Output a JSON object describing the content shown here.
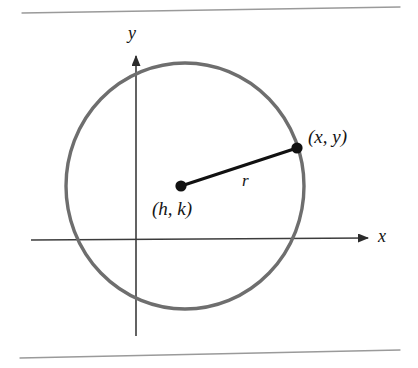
{
  "figure": {
    "kind": "geometry-diagram",
    "width": 418,
    "height": 368,
    "background_color": "#ffffff"
  },
  "colors": {
    "circle_stroke": "#6e6e6e",
    "axis_stroke": "#3c3c3c",
    "radius_stroke": "#111111",
    "dot_fill": "#111111",
    "rule_stroke": "#9a9a9a",
    "label_color": "#141414"
  },
  "rules": {
    "top": {
      "name": "top-rule",
      "x1": 22,
      "y1": 13,
      "x2": 400,
      "y2": 7
    },
    "bottom": {
      "name": "bottom-rule",
      "x1": 20,
      "y1": 358,
      "x2": 400,
      "y2": 350
    }
  },
  "axes": {
    "x_axis": {
      "label": "x",
      "x1": 31,
      "y1": 240,
      "x2": 368,
      "y2": 238,
      "arrow": "right",
      "label_x": 378,
      "label_y": 236
    },
    "y_axis": {
      "label": "y",
      "x1": 136,
      "y1": 336,
      "x2": 136,
      "y2": 56,
      "arrow": "up",
      "label_x": 133,
      "label_y": 33
    }
  },
  "circle": {
    "name": "circle-outline",
    "center_x": 185,
    "center_y": 186,
    "radius_x": 119,
    "radius_y": 123,
    "stroke_width": 3.4
  },
  "center_point": {
    "name": "center-point",
    "label": "(h, k)",
    "cx": 181,
    "cy": 186,
    "dot_radius": 5.6,
    "label_x": 152,
    "label_y": 199
  },
  "circumference_point": {
    "name": "circumference-point",
    "label": "(x, y)",
    "cx": 297,
    "cy": 148,
    "dot_radius": 5.6,
    "label_x": 308,
    "label_y": 127
  },
  "radius_segment": {
    "name": "radius-segment",
    "label": "r",
    "x1": 181,
    "y1": 186,
    "x2": 297,
    "y2": 148,
    "stroke_width": 3.2,
    "label_x": 242,
    "label_y": 172
  }
}
